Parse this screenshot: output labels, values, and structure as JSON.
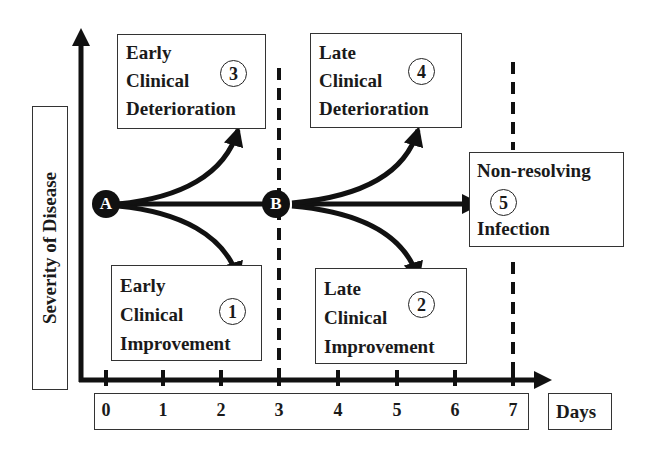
{
  "diagram": {
    "y_axis_label": "Severity of Disease",
    "x_axis_label": "Days",
    "x_ticks": [
      "0",
      "1",
      "2",
      "3",
      "4",
      "5",
      "6",
      "7"
    ],
    "nodes": [
      {
        "id": "A",
        "label": "A"
      },
      {
        "id": "B",
        "label": "B"
      }
    ],
    "outcomes": [
      {
        "number": "3",
        "lines": [
          "Early",
          "Clinical",
          "Deterioration"
        ]
      },
      {
        "number": "1",
        "lines": [
          "Early",
          "Clinical",
          "Improvement"
        ]
      },
      {
        "number": "4",
        "lines": [
          "Late",
          "Clinical",
          "Deterioration"
        ]
      },
      {
        "number": "2",
        "lines": [
          "Late",
          "Clinical",
          "Improvement"
        ]
      },
      {
        "number": "5",
        "lines": [
          "Non-resolving",
          "Infection"
        ]
      }
    ],
    "dashed_lines_at_days": [
      "3",
      "7"
    ],
    "colors": {
      "ink": "#111111",
      "box_border": "#333333",
      "background": "#ffffff"
    }
  }
}
